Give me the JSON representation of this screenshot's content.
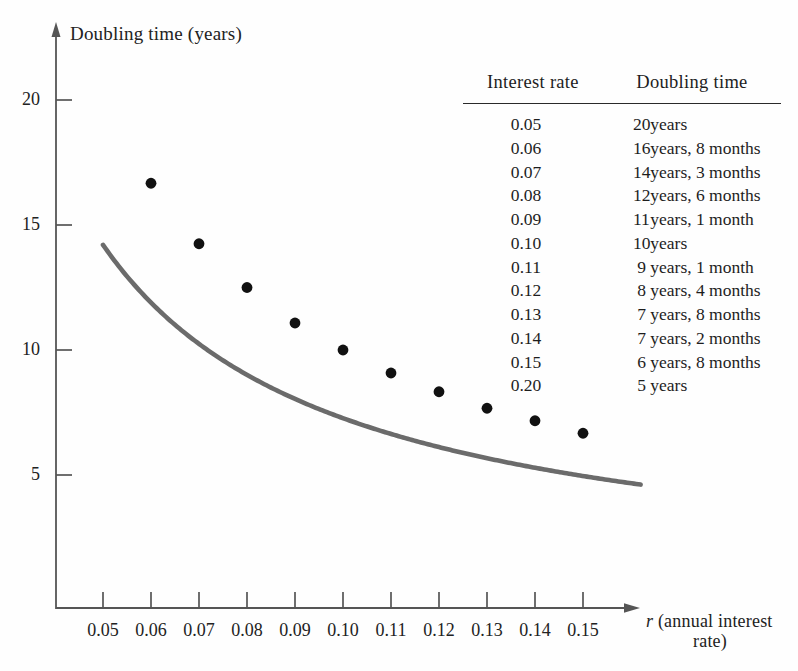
{
  "chart_data": {
    "type": "line",
    "title": "",
    "xlabel": "r (annual interest rate)",
    "ylabel": "Doubling time (years)",
    "x": [
      0.05,
      0.06,
      0.07,
      0.08,
      0.09,
      0.1,
      0.11,
      0.12,
      0.13,
      0.14,
      0.15
    ],
    "values": [
      20.0,
      16.67,
      14.25,
      12.5,
      11.08,
      10.0,
      9.08,
      8.33,
      7.67,
      7.17,
      6.67
    ],
    "series": [
      {
        "name": "Doubling time",
        "values": [
          20.0,
          16.67,
          14.25,
          12.5,
          11.08,
          10.0,
          9.08,
          8.33,
          7.67,
          7.17,
          6.67
        ]
      }
    ],
    "marked_points": [
      {
        "x": 0.06,
        "y": 16.67
      },
      {
        "x": 0.07,
        "y": 14.25
      },
      {
        "x": 0.08,
        "y": 12.5
      },
      {
        "x": 0.09,
        "y": 11.08
      },
      {
        "x": 0.1,
        "y": 10.0
      },
      {
        "x": 0.11,
        "y": 9.08
      },
      {
        "x": 0.12,
        "y": 8.33
      },
      {
        "x": 0.13,
        "y": 7.67
      },
      {
        "x": 0.14,
        "y": 7.17
      },
      {
        "x": 0.15,
        "y": 6.67
      }
    ],
    "xlim": [
      0.044,
      0.162
    ],
    "ylim": [
      0.0,
      22.5
    ],
    "xticks": [
      0.05,
      0.06,
      0.07,
      0.08,
      0.09,
      0.1,
      0.11,
      0.12,
      0.13,
      0.14,
      0.15
    ],
    "xtick_labels": [
      "0.05",
      "0.06",
      "0.07",
      "0.08",
      "0.09",
      "0.10",
      "0.11",
      "0.12",
      "0.13",
      "0.14",
      "0.15"
    ],
    "yticks": [
      5,
      10,
      15,
      20
    ],
    "ytick_labels": [
      "5",
      "10",
      "15",
      "20"
    ],
    "grid": false,
    "legend": "none",
    "curve_color": "#6b6b6b",
    "marker_color": "#111111",
    "axis_color": "#4a4a4a"
  },
  "axes": {
    "y_title": "Doubling time (years)",
    "x_title_variable": "r",
    "x_title_line1": "(annual interest",
    "x_title_line2": "rate)",
    "ytick_labels": [
      "20",
      "15",
      "10",
      "5"
    ],
    "xtick_labels": [
      "0.05",
      "0.06",
      "0.07",
      "0.08",
      "0.09",
      "0.10",
      "0.11",
      "0.12",
      "0.13",
      "0.14",
      "0.15"
    ]
  },
  "table": {
    "headers": {
      "rate": "Interest rate",
      "time": "Doubling time"
    },
    "rows": [
      {
        "rate": "0.05",
        "num": "20",
        "time": "years"
      },
      {
        "rate": "0.06",
        "num": "16",
        "time": "years, 8 months"
      },
      {
        "rate": "0.07",
        "num": "14",
        "time": "years, 3 months"
      },
      {
        "rate": "0.08",
        "num": "12",
        "time": "years, 6 months"
      },
      {
        "rate": "0.09",
        "num": "11",
        "time": "years, 1 month"
      },
      {
        "rate": "0.10",
        "num": "10",
        "time": "years"
      },
      {
        "rate": "0.11",
        "num": "9",
        "time": "years, 1 month"
      },
      {
        "rate": "0.12",
        "num": "8",
        "time": "years, 4 months"
      },
      {
        "rate": "0.13",
        "num": "7",
        "time": "years, 8 months"
      },
      {
        "rate": "0.14",
        "num": "7",
        "time": "years, 2 months"
      },
      {
        "rate": "0.15",
        "num": "6",
        "time": "years, 8 months"
      },
      {
        "rate": "0.20",
        "num": "5",
        "time": "years"
      }
    ]
  }
}
